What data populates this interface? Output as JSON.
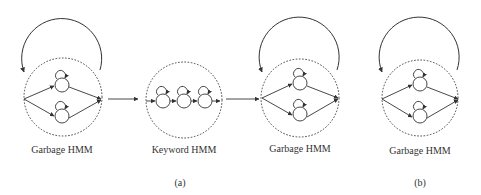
{
  "figure": {
    "panels": [
      {
        "id": "a",
        "caption": "(a)",
        "models": [
          {
            "label": "Garbage HMM",
            "type": "garbage",
            "states": 2,
            "has_loop_back": true
          },
          {
            "label": "Keyword HMM",
            "type": "keyword",
            "states": 3,
            "has_loop_back": false
          },
          {
            "label": "Garbage HMM",
            "type": "garbage",
            "states": 2,
            "has_loop_back": true
          }
        ],
        "connections": [
          "Garbage HMM -> Keyword HMM",
          "Keyword HMM -> Garbage HMM"
        ]
      },
      {
        "id": "b",
        "caption": "(b)",
        "models": [
          {
            "label": "Garbage HMM",
            "type": "garbage",
            "states": 2,
            "has_loop_back": true
          }
        ]
      }
    ]
  },
  "labels": {
    "garbage1": "Garbage HMM",
    "keyword": "Keyword HMM",
    "garbage2": "Garbage HMM",
    "garbage3": "Garbage HMM",
    "caption_a": "(a)",
    "caption_b": "(b)"
  },
  "colors": {
    "line": "#333333",
    "background": "#ffffff"
  }
}
